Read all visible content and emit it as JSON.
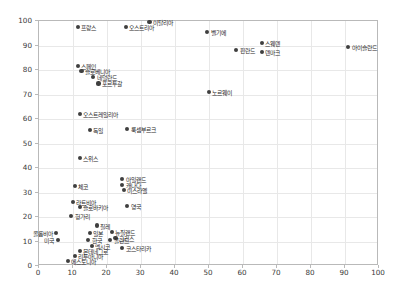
{
  "chart_data": {
    "type": "scatter",
    "title": "",
    "xlabel": "",
    "ylabel": "",
    "xlim": [
      0,
      100
    ],
    "ylim": [
      0,
      100
    ],
    "xticks": [
      0,
      10,
      20,
      30,
      40,
      50,
      60,
      70,
      80,
      90,
      100
    ],
    "yticks": [
      0,
      10,
      20,
      30,
      40,
      50,
      60,
      70,
      80,
      90,
      100
    ],
    "grid": true,
    "legend": "none",
    "marker_color": "#3f3f3f",
    "points": [
      {
        "label": "프랑스",
        "x": 11.5,
        "y": 97.5,
        "side": "right"
      },
      {
        "label": "오스트리아",
        "x": 25.5,
        "y": 97.5,
        "side": "right"
      },
      {
        "label": "이탈리아",
        "x": 32.5,
        "y": 99.5,
        "side": "right"
      },
      {
        "label": "벨기에",
        "x": 49.5,
        "y": 95.5,
        "side": "right"
      },
      {
        "label": "스웨덴",
        "x": 65.5,
        "y": 91.0,
        "side": "right"
      },
      {
        "label": "핀란드",
        "x": 58.0,
        "y": 88.0,
        "side": "right"
      },
      {
        "label": "덴마크",
        "x": 65.5,
        "y": 87.5,
        "side": "right"
      },
      {
        "label": "아이슬란드",
        "x": 91.0,
        "y": 89.5,
        "side": "right"
      },
      {
        "label": "스페인",
        "x": 11.5,
        "y": 81.5,
        "side": "right"
      },
      {
        "label": "슬로베니아",
        "x": 12.5,
        "y": 79.5,
        "side": "right"
      },
      {
        "label": "네덜란드",
        "x": 16.0,
        "y": 77.0,
        "side": "right"
      },
      {
        "label": "포르투갈",
        "x": 17.5,
        "y": 74.5,
        "side": "right"
      },
      {
        "label": "노르웨이",
        "x": 50.0,
        "y": 71.0,
        "side": "right"
      },
      {
        "label": "오스트레일리아",
        "x": 12.0,
        "y": 62.0,
        "side": "right"
      },
      {
        "label": "독일",
        "x": 15.0,
        "y": 55.5,
        "side": "right"
      },
      {
        "label": "룩셈부르크",
        "x": 26.0,
        "y": 56.0,
        "side": "right"
      },
      {
        "label": "스위스",
        "x": 12.0,
        "y": 44.0,
        "side": "right"
      },
      {
        "label": "아일랜드",
        "x": 24.5,
        "y": 35.5,
        "side": "right"
      },
      {
        "label": "캐나다",
        "x": 24.5,
        "y": 33.0,
        "side": "right"
      },
      {
        "label": "이스라엘",
        "x": 25.0,
        "y": 31.0,
        "side": "right"
      },
      {
        "label": "체코",
        "x": 10.5,
        "y": 32.5,
        "side": "right"
      },
      {
        "label": "라트비아",
        "x": 10.0,
        "y": 26.0,
        "side": "right"
      },
      {
        "label": "슬로바키아",
        "x": 12.0,
        "y": 24.0,
        "side": "right"
      },
      {
        "label": "영국",
        "x": 26.0,
        "y": 24.5,
        "side": "right"
      },
      {
        "label": "헝가리",
        "x": 9.5,
        "y": 20.5,
        "side": "right"
      },
      {
        "label": "칠레",
        "x": 17.0,
        "y": 16.5,
        "side": "right"
      },
      {
        "label": "콜롬비아",
        "x": 5.0,
        "y": 13.5,
        "side": "left"
      },
      {
        "label": "일본",
        "x": 15.0,
        "y": 13.5,
        "side": "right"
      },
      {
        "label": "뉴질랜드",
        "x": 21.5,
        "y": 14.0,
        "side": "right"
      },
      {
        "label": "그리스",
        "x": 22.5,
        "y": 11.5,
        "side": "right"
      },
      {
        "label": "미국",
        "x": 5.5,
        "y": 10.5,
        "side": "left"
      },
      {
        "label": "한국",
        "x": 14.5,
        "y": 10.5,
        "side": "right"
      },
      {
        "label": "폴란드",
        "x": 21.0,
        "y": 10.5,
        "side": "right"
      },
      {
        "label": "멕시코",
        "x": 15.5,
        "y": 8.0,
        "side": "right"
      },
      {
        "label": "코스타리카",
        "x": 24.5,
        "y": 7.5,
        "side": "right"
      },
      {
        "label": "몬테네그로",
        "x": 12.0,
        "y": 6.0,
        "side": "right"
      },
      {
        "label": "리투아니아",
        "x": 10.5,
        "y": 4.0,
        "side": "right"
      },
      {
        "label": "에스토니아",
        "x": 8.5,
        "y": 2.0,
        "side": "right"
      }
    ]
  }
}
